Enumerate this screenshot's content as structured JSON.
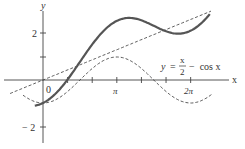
{
  "chart_data": {
    "type": "line",
    "title": "",
    "xlabel": "x",
    "ylabel": "y",
    "x_ticks": [
      {
        "value": 0,
        "label": "0"
      },
      {
        "value": 1.0472,
        "label": ""
      },
      {
        "value": 2.0944,
        "label": ""
      },
      {
        "value": 3.1416,
        "label": "π"
      },
      {
        "value": 4.1888,
        "label": ""
      },
      {
        "value": 5.236,
        "label": ""
      },
      {
        "value": 6.2832,
        "label": "2π"
      }
    ],
    "y_ticks": [
      {
        "value": 2,
        "label": "2"
      },
      {
        "value": 1,
        "label": ""
      },
      {
        "value": -2,
        "label": "−2"
      }
    ],
    "xlim": [
      -1.6,
      8.2
    ],
    "ylim": [
      -2.6,
      3.1
    ],
    "series": [
      {
        "name": "y = x/2 − cos x",
        "style": "solid",
        "formula": "x/2 - cos(x)",
        "x_range": [
          -0.35,
          7.1
        ]
      },
      {
        "name": "y = x/2",
        "style": "dashed",
        "formula": "x/2",
        "x_range": [
          -1.4,
          7.15
        ]
      },
      {
        "name": "y = −cos x",
        "style": "dashed",
        "formula": "-cos(x)",
        "x_range": [
          -0.85,
          7.2
        ]
      }
    ],
    "annotations": [
      {
        "text_y": "y",
        "text_eq": "=",
        "numerator": "x",
        "denominator": "2",
        "text_rest": "− cos x"
      }
    ]
  },
  "labels": {
    "x_axis": "x",
    "y_axis": "y",
    "origin": "0",
    "pi": "π",
    "two_pi": "2π",
    "y_two": "2",
    "y_neg_two": "− 2",
    "eq_y": "y",
    "eq_equals": "=",
    "eq_num": "x",
    "eq_den": "2",
    "eq_rest": "−  cos x"
  }
}
